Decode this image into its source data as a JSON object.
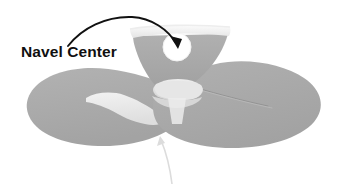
{
  "diagram": {
    "title": "Navel Center",
    "type": "anatomical-illustration",
    "callout": {
      "label": "Navel Center",
      "label_color": "#101010",
      "arrow_color": "#111111",
      "arrow_target": "navel-circle"
    },
    "pointer_arrow": {
      "color": "#d8d8d8",
      "direction": "up"
    },
    "colors": {
      "background": "#ffffff",
      "body_gray": "#a9a9a9",
      "body_gray_dark": "#9b9b9b",
      "highlight_light": "#efefef",
      "highlight_mid": "#dcdcdc",
      "navel_white": "#ffffff",
      "crease_line": "#8f8f8f"
    },
    "parts": [
      {
        "name": "top-band",
        "label": "Top Band"
      },
      {
        "name": "v-panel",
        "label": "V Panel"
      },
      {
        "name": "navel-circle",
        "label": "Navel"
      },
      {
        "name": "center-knot",
        "label": "Center Knot"
      },
      {
        "name": "left-wing",
        "label": "Left Wing"
      },
      {
        "name": "right-wing",
        "label": "Right Wing"
      },
      {
        "name": "left-wing-highlight",
        "label": "Left Wing Highlight"
      },
      {
        "name": "right-wing-crease",
        "label": "Right Wing Crease"
      }
    ]
  }
}
